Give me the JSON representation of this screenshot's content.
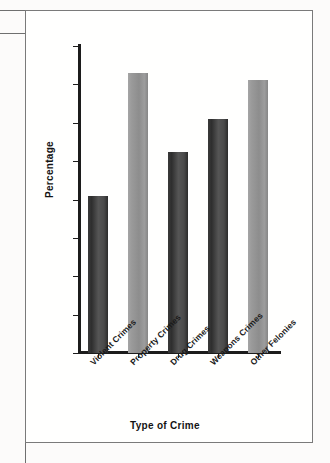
{
  "chart_data": {
    "type": "bar",
    "title": "",
    "xlabel": "Type of Crime",
    "ylabel": "Percentage",
    "categories": [
      "Violent Crimes",
      "Property Crimes",
      "Drug Crimes",
      "Weapons Crimes",
      "Other Felonies"
    ],
    "values": [
      20.4,
      36.5,
      26.2,
      30.5,
      35.6
    ],
    "ylim": [
      0,
      40
    ],
    "yticks": [
      0,
      5,
      10,
      15,
      20,
      25,
      30,
      35,
      40
    ],
    "ytick_labels": [
      "0",
      "5",
      "10",
      "15",
      "20",
      "25",
      "30",
      "35",
      "40"
    ],
    "grid": false,
    "legend": null,
    "bar_colors": [
      "#3f3f3f",
      "#949494",
      "#3f3f3f",
      "#3f3f3f",
      "#949494"
    ],
    "axis_color": "#1c1c1c",
    "background_color": "#ffffff",
    "frame_color": "#7a7a7a"
  }
}
